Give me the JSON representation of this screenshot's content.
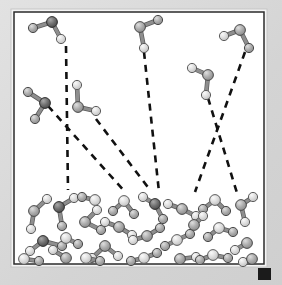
{
  "figure": {
    "name": "molecular-phase-diagram",
    "background_color": "#d5d5d5",
    "frame": {
      "x": 14,
      "y": 12,
      "width": 250,
      "height": 252,
      "border_color": "#2b2b2b",
      "border_width": 1.5,
      "fill_color": "#ffffff",
      "outer_border_color": "#f2f2f2"
    },
    "corner_marker": {
      "label": "corner-square-marker",
      "x": 258,
      "y": 268,
      "width": 13,
      "height": 12,
      "color": "#1b1b1b"
    }
  },
  "style": {
    "atom_light_fill": "#d2d2d2",
    "atom_light_highlight": "#f4f4f4",
    "atom_light_stroke": "#5d5d5d",
    "atom_mid_fill": "#a3a3a3",
    "atom_mid_highlight": "#d8d8d8",
    "atom_mid_stroke": "#4a4a4a",
    "atom_dark_fill": "#6a6a6a",
    "atom_dark_highlight": "#a6a6a6",
    "atom_dark_stroke": "#2e2e2e",
    "bond_color": "#8e8e8e",
    "bond_stroke": "#5a5a5a",
    "bond_width": 3.2,
    "atom_radius_center": 5.4,
    "atom_radius_outer": 4.6,
    "trajectory_color": "#111111",
    "trajectory_width": 2.6,
    "trajectory_dash": "7,6"
  },
  "phases": {
    "gas_label": "gas-phase-region",
    "liquid_label": "liquid-phase-region",
    "liquid_top_y": 195
  },
  "trajectories": [
    {
      "name": "trajectory-1-vertical-left",
      "x1": 66,
      "y1": 46,
      "x2": 68,
      "y2": 190
    },
    {
      "name": "trajectory-2-diagonal-left",
      "x1": 48,
      "y1": 106,
      "x2": 126,
      "y2": 193
    },
    {
      "name": "trajectory-3-diagonal-mid",
      "x1": 96,
      "y1": 119,
      "x2": 150,
      "y2": 190
    },
    {
      "name": "trajectory-4-vertical-center",
      "x1": 144,
      "y1": 52,
      "x2": 159,
      "y2": 192
    },
    {
      "name": "trajectory-5-diagonal-right-down",
      "x1": 208,
      "y1": 98,
      "x2": 237,
      "y2": 193
    },
    {
      "name": "trajectory-6-diagonal-right-up",
      "x1": 245,
      "y1": 52,
      "x2": 195,
      "y2": 192
    }
  ],
  "gas_molecules": [
    {
      "name": "gas-molecule-1",
      "center": {
        "x": 52,
        "y": 22,
        "shade": "dark"
      },
      "outer": [
        {
          "x": 33,
          "y": 28,
          "shade": "mid"
        },
        {
          "x": 61,
          "y": 39,
          "shade": "light"
        }
      ]
    },
    {
      "name": "gas-molecule-2",
      "center": {
        "x": 45,
        "y": 103,
        "shade": "dark"
      },
      "outer": [
        {
          "x": 28,
          "y": 92,
          "shade": "mid"
        },
        {
          "x": 35,
          "y": 119,
          "shade": "mid"
        }
      ]
    },
    {
      "name": "gas-molecule-3",
      "center": {
        "x": 78,
        "y": 107,
        "shade": "mid"
      },
      "outer": [
        {
          "x": 77,
          "y": 85,
          "shade": "light"
        },
        {
          "x": 96,
          "y": 111,
          "shade": "light"
        }
      ]
    },
    {
      "name": "gas-molecule-4",
      "center": {
        "x": 140,
        "y": 27,
        "shade": "mid"
      },
      "outer": [
        {
          "x": 158,
          "y": 20,
          "shade": "mid"
        },
        {
          "x": 144,
          "y": 48,
          "shade": "light"
        }
      ]
    },
    {
      "name": "gas-molecule-5",
      "center": {
        "x": 208,
        "y": 75,
        "shade": "mid"
      },
      "outer": [
        {
          "x": 192,
          "y": 68,
          "shade": "light"
        },
        {
          "x": 206,
          "y": 95,
          "shade": "light"
        }
      ]
    },
    {
      "name": "gas-molecule-6",
      "center": {
        "x": 240,
        "y": 30,
        "shade": "mid"
      },
      "outer": [
        {
          "x": 224,
          "y": 36,
          "shade": "light"
        },
        {
          "x": 249,
          "y": 48,
          "shade": "mid"
        }
      ]
    }
  ],
  "liquid_molecules": [
    {
      "name": "liquid-molecule-1",
      "center": {
        "x": 34,
        "y": 211,
        "shade": "mid"
      },
      "outer": [
        {
          "x": 47,
          "y": 199,
          "shade": "light"
        },
        {
          "x": 31,
          "y": 229,
          "shade": "light"
        }
      ]
    },
    {
      "name": "liquid-molecule-2",
      "center": {
        "x": 59,
        "y": 207,
        "shade": "dark"
      },
      "outer": [
        {
          "x": 74,
          "y": 198,
          "shade": "light"
        },
        {
          "x": 62,
          "y": 226,
          "shade": "mid"
        }
      ]
    },
    {
      "name": "liquid-molecule-3",
      "center": {
        "x": 85,
        "y": 222,
        "shade": "mid"
      },
      "outer": [
        {
          "x": 97,
          "y": 210,
          "shade": "light"
        },
        {
          "x": 101,
          "y": 230,
          "shade": "mid"
        }
      ]
    },
    {
      "name": "liquid-molecule-4",
      "center": {
        "x": 43,
        "y": 241,
        "shade": "dark"
      },
      "outer": [
        {
          "x": 30,
          "y": 251,
          "shade": "light"
        },
        {
          "x": 62,
          "y": 246,
          "shade": "mid"
        }
      ]
    },
    {
      "name": "liquid-molecule-5",
      "center": {
        "x": 24,
        "y": 259,
        "shade": "light"
      },
      "outer": [
        {
          "x": 39,
          "y": 261,
          "shade": "mid"
        }
      ]
    },
    {
      "name": "liquid-molecule-6",
      "center": {
        "x": 66,
        "y": 258,
        "shade": "mid"
      },
      "outer": [
        {
          "x": 53,
          "y": 250,
          "shade": "light"
        }
      ]
    },
    {
      "name": "liquid-molecule-7",
      "center": {
        "x": 105,
        "y": 246,
        "shade": "mid"
      },
      "outer": [
        {
          "x": 92,
          "y": 258,
          "shade": "light"
        },
        {
          "x": 118,
          "y": 256,
          "shade": "light"
        }
      ]
    },
    {
      "name": "liquid-molecule-8",
      "center": {
        "x": 86,
        "y": 258,
        "shade": "light"
      },
      "outer": [
        {
          "x": 100,
          "y": 261,
          "shade": "mid"
        }
      ]
    },
    {
      "name": "liquid-molecule-9",
      "center": {
        "x": 124,
        "y": 201,
        "shade": "light"
      },
      "outer": [
        {
          "x": 134,
          "y": 214,
          "shade": "mid"
        },
        {
          "x": 113,
          "y": 211,
          "shade": "mid"
        }
      ]
    },
    {
      "name": "liquid-molecule-10",
      "center": {
        "x": 119,
        "y": 227,
        "shade": "mid"
      },
      "outer": [
        {
          "x": 105,
          "y": 222,
          "shade": "light"
        },
        {
          "x": 132,
          "y": 235,
          "shade": "light"
        }
      ]
    },
    {
      "name": "liquid-molecule-11",
      "center": {
        "x": 155,
        "y": 204,
        "shade": "dark"
      },
      "outer": [
        {
          "x": 143,
          "y": 197,
          "shade": "light"
        },
        {
          "x": 163,
          "y": 219,
          "shade": "mid"
        }
      ]
    },
    {
      "name": "liquid-molecule-12",
      "center": {
        "x": 182,
        "y": 209,
        "shade": "mid"
      },
      "outer": [
        {
          "x": 168,
          "y": 204,
          "shade": "light"
        },
        {
          "x": 196,
          "y": 216,
          "shade": "light"
        }
      ]
    },
    {
      "name": "liquid-molecule-13",
      "center": {
        "x": 147,
        "y": 236,
        "shade": "mid"
      },
      "outer": [
        {
          "x": 133,
          "y": 240,
          "shade": "light"
        },
        {
          "x": 160,
          "y": 228,
          "shade": "mid"
        }
      ]
    },
    {
      "name": "liquid-molecule-14",
      "center": {
        "x": 177,
        "y": 240,
        "shade": "light"
      },
      "outer": [
        {
          "x": 165,
          "y": 246,
          "shade": "mid"
        },
        {
          "x": 190,
          "y": 234,
          "shade": "mid"
        }
      ]
    },
    {
      "name": "liquid-molecule-15",
      "center": {
        "x": 144,
        "y": 258,
        "shade": "light"
      },
      "outer": [
        {
          "x": 131,
          "y": 261,
          "shade": "mid"
        },
        {
          "x": 157,
          "y": 253,
          "shade": "mid"
        }
      ]
    },
    {
      "name": "liquid-molecule-16",
      "center": {
        "x": 180,
        "y": 259,
        "shade": "mid"
      },
      "outer": [
        {
          "x": 196,
          "y": 257,
          "shade": "light"
        }
      ]
    },
    {
      "name": "liquid-molecule-17",
      "center": {
        "x": 215,
        "y": 200,
        "shade": "light"
      },
      "outer": [
        {
          "x": 226,
          "y": 211,
          "shade": "mid"
        },
        {
          "x": 203,
          "y": 209,
          "shade": "mid"
        }
      ]
    },
    {
      "name": "liquid-molecule-18",
      "center": {
        "x": 241,
        "y": 205,
        "shade": "mid"
      },
      "outer": [
        {
          "x": 253,
          "y": 197,
          "shade": "light"
        },
        {
          "x": 245,
          "y": 222,
          "shade": "light"
        }
      ]
    },
    {
      "name": "liquid-molecule-19",
      "center": {
        "x": 219,
        "y": 228,
        "shade": "light"
      },
      "outer": [
        {
          "x": 233,
          "y": 232,
          "shade": "mid"
        },
        {
          "x": 208,
          "y": 237,
          "shade": "mid"
        }
      ]
    },
    {
      "name": "liquid-molecule-20",
      "center": {
        "x": 247,
        "y": 243,
        "shade": "mid"
      },
      "outer": [
        {
          "x": 235,
          "y": 250,
          "shade": "light"
        }
      ]
    },
    {
      "name": "liquid-molecule-21",
      "center": {
        "x": 213,
        "y": 255,
        "shade": "light"
      },
      "outer": [
        {
          "x": 228,
          "y": 258,
          "shade": "mid"
        },
        {
          "x": 200,
          "y": 260,
          "shade": "mid"
        }
      ]
    },
    {
      "name": "liquid-molecule-22",
      "center": {
        "x": 95,
        "y": 200,
        "shade": "light"
      },
      "outer": [
        {
          "x": 82,
          "y": 197,
          "shade": "mid"
        }
      ]
    },
    {
      "name": "liquid-molecule-23",
      "center": {
        "x": 252,
        "y": 259,
        "shade": "mid"
      },
      "outer": [
        {
          "x": 243,
          "y": 262,
          "shade": "light"
        }
      ]
    },
    {
      "name": "liquid-molecule-24",
      "center": {
        "x": 66,
        "y": 238,
        "shade": "light"
      },
      "outer": [
        {
          "x": 78,
          "y": 244,
          "shade": "mid"
        }
      ]
    },
    {
      "name": "liquid-molecule-25",
      "center": {
        "x": 194,
        "y": 225,
        "shade": "mid"
      },
      "outer": [
        {
          "x": 203,
          "y": 216,
          "shade": "light"
        }
      ]
    }
  ]
}
